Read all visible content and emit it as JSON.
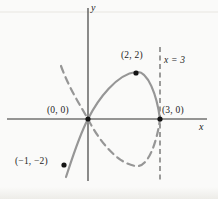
{
  "figure": {
    "colors": {
      "bg": "#fafaf9",
      "axis": "#2e2e2e",
      "curve": "#969696",
      "guide": "#4d4d4d",
      "dot": "#141414",
      "text": "#1d1d1d"
    }
  },
  "chart_data": {
    "type": "line",
    "title": "",
    "x_axis_label": "x",
    "y_axis_label": "y",
    "xlim": [
      -3.5,
      5
    ],
    "ylim": [
      -2.7,
      4.8
    ],
    "grid": false,
    "legend": "none",
    "labeled_points": [
      {
        "label": "(0, 0)",
        "x": 0,
        "y": 0
      },
      {
        "label": "(2, 2)",
        "x": 2,
        "y": 2
      },
      {
        "label": "(3, 0)",
        "x": 3,
        "y": 0
      },
      {
        "label": "(−1, −2)",
        "x": -1,
        "y": -2
      }
    ],
    "vertical_line": {
      "label": "x = 3",
      "x": 3,
      "style": "dashed"
    },
    "series": [
      {
        "name": "solid-branch",
        "style": "solid",
        "points": [
          [
            -1,
            -2
          ],
          [
            0,
            0
          ],
          [
            2,
            2
          ],
          [
            3,
            0
          ]
        ]
      },
      {
        "name": "mirrored-dashed-branch",
        "style": "dashed",
        "points": [
          [
            -1,
            2
          ],
          [
            0,
            0
          ],
          [
            2,
            -2
          ],
          [
            3,
            0
          ]
        ]
      }
    ]
  }
}
